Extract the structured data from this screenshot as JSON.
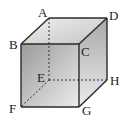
{
  "figure": {
    "type": "cube",
    "vertices": {
      "A": {
        "label": "A",
        "x": 49,
        "y": 18
      },
      "B": {
        "label": "B",
        "x": 21,
        "y": 44
      },
      "C": {
        "label": "C",
        "x": 79,
        "y": 44
      },
      "D": {
        "label": "D",
        "x": 107,
        "y": 18
      },
      "E": {
        "label": "E",
        "x": 49,
        "y": 80
      },
      "F": {
        "label": "F",
        "x": 21,
        "y": 107
      },
      "G": {
        "label": "G",
        "x": 79,
        "y": 107
      },
      "H": {
        "label": "H",
        "x": 107,
        "y": 80
      }
    },
    "hidden_edges": [
      "AE",
      "EF",
      "EH"
    ],
    "colors": {
      "edge": "#2a2a2a",
      "front_face_dark": "#9a9a9a",
      "front_face_light": "#e6e6e6",
      "top_face": "#d8d8d8",
      "right_face_dark": "#b0b0b0",
      "right_face_light": "#e8e8e8"
    }
  }
}
